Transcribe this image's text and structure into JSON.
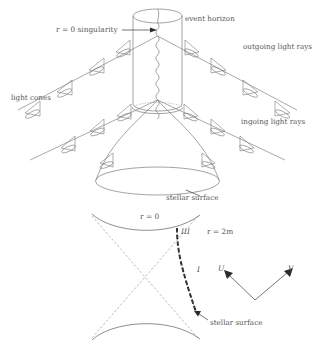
{
  "figure": {
    "title_semantic": "gravitational-collapse-spacetime-and-kruskal-diagram",
    "background_color": "#ffffff",
    "line_color": "#6b6b6b",
    "text_color": "#555555",
    "accent_color": "#1c1c1c"
  },
  "upper_diagram": {
    "name": "collapsing-star-spacetime-diagram",
    "labels": {
      "singularity": "r = 0 singularity",
      "event_horizon": "event horizon",
      "outgoing_rays": "outgoing light rays",
      "ingoing_rays": "ingoing light rays",
      "light_cones": "light cones",
      "stellar_surface": "stellar surface"
    },
    "elements": {
      "horizon_cylinder": "event-horizon-cylinder",
      "singularity_wavy_line": "r-zero-singularity-wavy-line",
      "star_surface_funnel": "stellar-surface-funnel",
      "base_ellipse": "stellar-surface-base-ellipse",
      "light_cone_count": 16
    }
  },
  "lower_diagram": {
    "name": "kruskal-szekeres-diagram",
    "labels": {
      "r_zero": "r = 0",
      "r_2m": "r = 2m",
      "region_III": "III",
      "region_I": "I",
      "axis_U": "U",
      "axis_V": "V",
      "stellar_surface": "stellar surface"
    },
    "elements": {
      "upper_hyperbola": "r-equals-zero-upper-singularity",
      "lower_hyperbola": "r-equals-zero-lower-singularity",
      "horizon_lines": "r-equals-2m-null-lines",
      "worldline": "stellar-surface-worldline",
      "null_axes": "U-V-null-coordinate-axes"
    }
  }
}
